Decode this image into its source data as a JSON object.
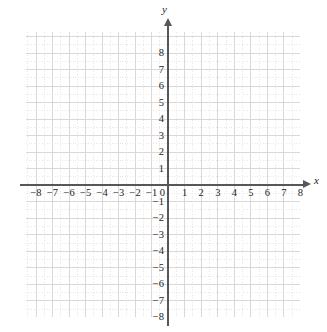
{
  "figure": {
    "width": 327,
    "height": 332,
    "background": "#ffffff"
  },
  "chart_data": {
    "type": "scatter",
    "title": "",
    "subtitle": "",
    "xlabel": "x",
    "ylabel": "y",
    "xlim": [
      -8.6,
      8.0
    ],
    "ylim": [
      -8.0,
      8.6
    ],
    "x_ticks": [
      -8,
      -7,
      -6,
      -5,
      -4,
      -3,
      -2,
      -1,
      0,
      1,
      2,
      3,
      4,
      5,
      6,
      7,
      8
    ],
    "y_ticks": [
      8,
      7,
      6,
      5,
      4,
      3,
      2,
      1,
      -1,
      -2,
      -3,
      -4,
      -5,
      -6,
      -7,
      -8
    ],
    "x_tick_labels": [
      "−8",
      "−7",
      "−6",
      "−5",
      "−4",
      "−3",
      "−2",
      "−1",
      "0",
      "1",
      "2",
      "3",
      "4",
      "5",
      "6",
      "7",
      "8"
    ],
    "y_tick_labels": [
      "8",
      "7",
      "6",
      "5",
      "4",
      "3",
      "2",
      "1",
      "−1",
      "−2",
      "−3",
      "−4",
      "−5",
      "−6",
      "−7",
      "−8"
    ],
    "origin_label": "0",
    "grid": true,
    "grid_major_step": 1,
    "grid_minor_subdivisions": 2,
    "legend": null,
    "series": [],
    "annotations": [],
    "axis_arrows": [
      "x-positive",
      "y-positive"
    ]
  },
  "axes": {
    "x_name": "x",
    "y_name": "y",
    "origin": "0",
    "x_labels": [
      "−8",
      "−7",
      "−6",
      "−5",
      "−4",
      "−3",
      "−2",
      "−1",
      "1",
      "2",
      "3",
      "4",
      "5",
      "6",
      "7",
      "8"
    ],
    "y_labels": [
      "8",
      "7",
      "6",
      "5",
      "4",
      "3",
      "2",
      "1",
      "−1",
      "−2",
      "−3",
      "−4",
      "−5",
      "−6",
      "−7",
      "−8"
    ]
  },
  "colors": {
    "axis": "#575757",
    "grid_major": "#dcd8d8",
    "grid_minor": "#e9e6e6",
    "text": "#1d1d1d",
    "background": "#ffffff"
  }
}
